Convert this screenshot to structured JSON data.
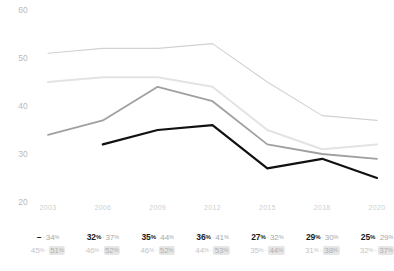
{
  "chart_data": {
    "type": "line",
    "title": "",
    "subtitle": "",
    "xlabel": "",
    "ylabel": "",
    "x": [
      "2003",
      "2006",
      "2009",
      "2012",
      "2015",
      "2018",
      "2020"
    ],
    "ylim": [
      20,
      60
    ],
    "xlim_categories": 7,
    "yticks": [
      "60",
      "50",
      "40",
      "30",
      "20"
    ],
    "ytick_values": [
      60,
      50,
      40,
      30,
      20
    ],
    "grid": false,
    "legend": "none",
    "series": [
      {
        "name": "series-top-outline",
        "color": "#d2d2d2",
        "width": 1.1,
        "values": [
          51,
          52,
          52,
          53,
          45,
          38,
          37
        ]
      },
      {
        "name": "series-light",
        "color": "#e3e3e3",
        "width": 2.0,
        "values": [
          45,
          46,
          46,
          44,
          35,
          31,
          32
        ]
      },
      {
        "name": "series-mid-gray",
        "color": "#a0a0a0",
        "width": 1.8,
        "values": [
          34,
          37,
          44,
          41,
          32,
          30,
          29
        ]
      },
      {
        "name": "series-black",
        "color": "#111111",
        "width": 2.2,
        "values": [
          null,
          32,
          35,
          36,
          27,
          29,
          25
        ]
      }
    ]
  },
  "axis": {
    "y_ticks": [
      "60",
      "50",
      "40",
      "30",
      "20"
    ],
    "x_ticks": [
      "2003",
      "2006",
      "2009",
      "2012",
      "2015",
      "2018",
      "2020"
    ]
  },
  "data_labels": {
    "columns": [
      {
        "year": "2003",
        "primary_left": "–",
        "primary_left_is_dash": true,
        "primary_right": "34",
        "secondary_left": "45",
        "secondary_right": "51",
        "secondary_right_boxed": true
      },
      {
        "year": "2006",
        "primary_left": "32",
        "primary_left_is_dash": false,
        "primary_right": "37",
        "secondary_left": "46",
        "secondary_right": "52",
        "secondary_right_boxed": true
      },
      {
        "year": "2009",
        "primary_left": "35",
        "primary_left_is_dash": false,
        "primary_right": "44",
        "secondary_left": "46",
        "secondary_right": "52",
        "secondary_right_boxed": true
      },
      {
        "year": "2012",
        "primary_left": "36",
        "primary_left_is_dash": false,
        "primary_right": "41",
        "secondary_left": "44",
        "secondary_right": "53",
        "secondary_right_boxed": true
      },
      {
        "year": "2015",
        "primary_left": "27",
        "primary_left_is_dash": false,
        "primary_right": "32",
        "secondary_left": "35",
        "secondary_right": "44",
        "secondary_right_boxed": true
      },
      {
        "year": "2018",
        "primary_left": "29",
        "primary_left_is_dash": false,
        "primary_right": "30",
        "secondary_left": "31",
        "secondary_right": "38",
        "secondary_right_boxed": true
      },
      {
        "year": "2020",
        "primary_left": "25",
        "primary_left_is_dash": false,
        "primary_right": "29",
        "secondary_left": "32",
        "secondary_right": "37",
        "secondary_right_boxed": true
      }
    ],
    "percent_symbol": "%",
    "separator": "·"
  },
  "colors": {
    "series_top_outline": "#d2d2d2",
    "series_light": "#e3e3e3",
    "series_mid_gray": "#a0a0a0",
    "series_black": "#111111",
    "axis_text": "#c2c2c2",
    "label_strong": "#1b1b1b",
    "label_soft": "#c6c6c6",
    "label_box_bg": "#e6e6e6"
  }
}
